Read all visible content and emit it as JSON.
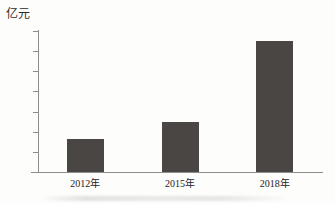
{
  "chart_data": {
    "type": "bar",
    "title": "",
    "subtitle": "",
    "xlabel": "",
    "ylabel": "亿元",
    "categories": [
      "2012年",
      "2015年",
      "2018年"
    ],
    "values": [
      33,
      50,
      130
    ],
    "series": [
      {
        "name": "",
        "values": [
          33,
          50,
          130
        ]
      }
    ],
    "ylim": [
      0,
      140
    ],
    "ytick_labels": [
      "0",
      "20",
      "40",
      "60",
      "80",
      "100",
      "120",
      "140"
    ],
    "ytick_values": [
      0,
      20,
      40,
      60,
      80,
      100,
      120,
      140
    ],
    "grid": false,
    "legend": false,
    "legend_position": "none",
    "bar_color": "#4a4643",
    "axis_color": "#8d8d8b",
    "background_color": "#fdfdfc",
    "annotations": []
  }
}
